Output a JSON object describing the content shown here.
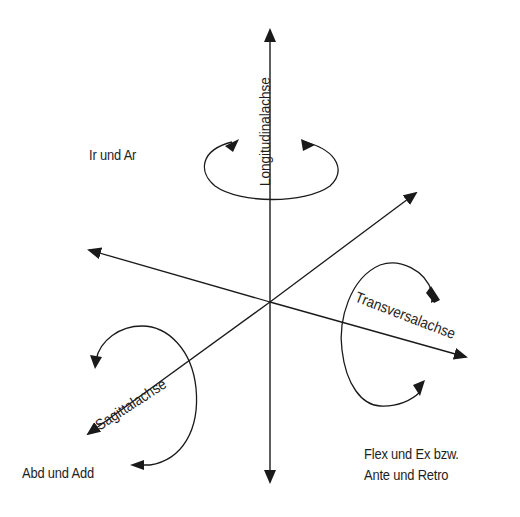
{
  "diagram": {
    "axes": {
      "longitudinal": {
        "label": "Longitudinalachse"
      },
      "transversal": {
        "label": "Transversalachse"
      },
      "sagittal": {
        "label": "Sagittalachse"
      }
    },
    "movements": {
      "longitudinal": {
        "label": "Ir und Ar"
      },
      "sagittal": {
        "label": "Abd und Add"
      },
      "transversal": {
        "line1": "Flex und Ex bzw.",
        "line2": "Ante und Retro"
      }
    },
    "colors": {
      "stroke": "#1a1a1a",
      "background": "#ffffff"
    }
  }
}
